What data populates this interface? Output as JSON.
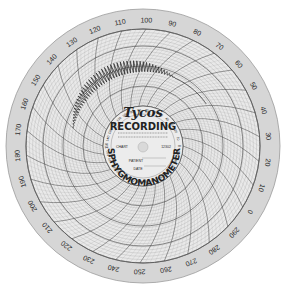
{
  "chart_data": {
    "type": "polar-recording-chart",
    "title": "Tycos",
    "subtitle": "RECORDING",
    "ring_label": "SPHYGMOMANOMETER",
    "fields": {
      "chart_label": "CHART",
      "chart_number": "12302",
      "patient_label": "PATIENT",
      "date_label": "DATE"
    },
    "outer_scale": {
      "unit": "mmHg",
      "labels": [
        "0",
        "10",
        "20",
        "30",
        "40",
        "50",
        "60",
        "70",
        "80",
        "90",
        "100",
        "110",
        "120",
        "130",
        "140",
        "150",
        "160",
        "170",
        "180",
        "190",
        "200",
        "210",
        "220",
        "230",
        "240",
        "250",
        "260",
        "270",
        "280",
        "290"
      ],
      "start_angle_deg": 0,
      "direction": "counter-clockwise-from-right",
      "range": [
        0,
        300
      ]
    },
    "trace": {
      "description": "oscillometric pulse trace",
      "start_mmHg": 150,
      "end_mmHg": 40,
      "peak_region_mmHg": [
        100,
        70
      ]
    },
    "colors": {
      "paper": "#e9e9e9",
      "rim": "#d6d6d6",
      "grid": "#555555",
      "ink": "#222222",
      "background": "#ffffff"
    }
  }
}
